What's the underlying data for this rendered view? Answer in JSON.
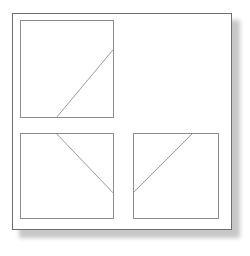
{
  "figure": {
    "title": "",
    "background_color": "#ffffff",
    "frame": {
      "name": "outer-frame",
      "x": 12,
      "y": 13,
      "width": 220,
      "height": 217,
      "border_color": "#6e6e6e",
      "fill_color": "#ffffff",
      "has_drop_shadow": true,
      "shadow_color": "#9a9a9a"
    },
    "line_color": "#8d8d8d",
    "panel_border_color": "#8d8d8d"
  },
  "panels": [
    {
      "name": "panel-top-left",
      "position": "top-left",
      "x": 20,
      "y": 20,
      "width": 94,
      "height": 98,
      "diagonal": {
        "direction": "up-right",
        "x1_pct": 39,
        "y1_pct": 100,
        "x2_pct": 100,
        "y2_pct": 30
      }
    },
    {
      "name": "panel-top-right",
      "position": "top-right",
      "x": 126,
      "y": 20,
      "width": 94,
      "height": 98,
      "empty": true,
      "diagonal": null
    },
    {
      "name": "panel-bottom-left",
      "position": "bottom-left",
      "x": 20,
      "y": 133,
      "width": 94,
      "height": 86,
      "diagonal": {
        "direction": "down-right",
        "x1_pct": 39,
        "y1_pct": 0,
        "x2_pct": 100,
        "y2_pct": 70
      }
    },
    {
      "name": "panel-bottom-right",
      "position": "bottom-right",
      "x": 133,
      "y": 133,
      "width": 86,
      "height": 86,
      "diagonal": {
        "direction": "up-right",
        "x1_pct": 0,
        "y1_pct": 69,
        "x2_pct": 69,
        "y2_pct": 0
      }
    }
  ]
}
